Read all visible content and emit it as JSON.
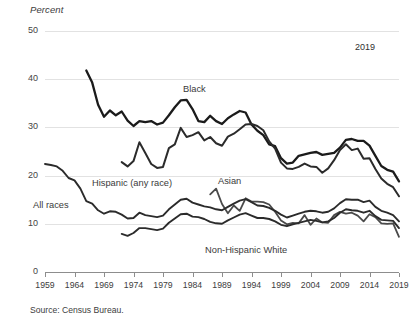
{
  "chart_data": {
    "type": "line",
    "title": "",
    "ylabel": "Percent",
    "xlabel": "",
    "ylim": [
      0,
      50
    ],
    "xlim": [
      1959,
      2019
    ],
    "yticks": [
      0,
      10,
      20,
      30,
      40,
      50
    ],
    "xticks": [
      1959,
      1964,
      1969,
      1974,
      1979,
      1984,
      1989,
      1994,
      1999,
      2004,
      2009,
      2014,
      2019
    ],
    "grid": true,
    "legend_position": "inline-annotations",
    "annotations": [
      "2019"
    ],
    "source": "Source: Census Bureau.",
    "series": [
      {
        "name": "Black",
        "color": "#1b1b1b",
        "width": 2.3,
        "x": [
          1966,
          1967,
          1968,
          1969,
          1970,
          1971,
          1972,
          1973,
          1974,
          1975,
          1976,
          1977,
          1978,
          1979,
          1980,
          1981,
          1982,
          1983,
          1984,
          1985,
          1986,
          1987,
          1988,
          1989,
          1990,
          1991,
          1992,
          1993,
          1994,
          1995,
          1996,
          1997,
          1998,
          1999,
          2000,
          2001,
          2002,
          2003,
          2004,
          2005,
          2006,
          2007,
          2008,
          2009,
          2010,
          2011,
          2012,
          2013,
          2014,
          2015,
          2016,
          2017,
          2018,
          2019
        ],
        "y": [
          41.8,
          39.3,
          34.7,
          32.2,
          33.5,
          32.5,
          33.3,
          31.4,
          30.3,
          31.3,
          31.1,
          31.3,
          30.6,
          31.0,
          32.5,
          34.2,
          35.6,
          35.7,
          33.8,
          31.3,
          31.1,
          32.4,
          31.3,
          30.7,
          31.9,
          32.7,
          33.4,
          33.1,
          30.6,
          29.3,
          28.4,
          26.5,
          26.1,
          23.6,
          22.5,
          22.7,
          24.1,
          24.4,
          24.7,
          24.9,
          24.3,
          24.5,
          24.7,
          25.8,
          27.4,
          27.6,
          27.2,
          27.2,
          26.2,
          24.1,
          22.0,
          21.2,
          20.8,
          18.8
        ]
      },
      {
        "name": "Hispanic (any race)",
        "color": "#2b2b2b",
        "width": 2.0,
        "x": [
          1972,
          1973,
          1974,
          1975,
          1976,
          1977,
          1978,
          1979,
          1980,
          1981,
          1982,
          1983,
          1984,
          1985,
          1986,
          1987,
          1988,
          1989,
          1990,
          1991,
          1992,
          1993,
          1994,
          1995,
          1996,
          1997,
          1998,
          1999,
          2000,
          2001,
          2002,
          2003,
          2004,
          2005,
          2006,
          2007,
          2008,
          2009,
          2010,
          2011,
          2012,
          2013,
          2014,
          2015,
          2016,
          2017,
          2018,
          2019
        ],
        "y": [
          22.8,
          21.9,
          23.0,
          26.9,
          24.7,
          22.4,
          21.6,
          21.8,
          25.7,
          26.5,
          29.9,
          28.0,
          28.4,
          29.0,
          27.3,
          28.0,
          26.7,
          26.2,
          28.1,
          28.7,
          29.6,
          30.6,
          30.7,
          30.3,
          29.4,
          27.1,
          25.6,
          22.7,
          21.5,
          21.4,
          21.8,
          22.5,
          21.9,
          21.8,
          20.6,
          21.5,
          23.2,
          25.3,
          26.5,
          25.3,
          25.6,
          23.5,
          23.6,
          21.4,
          19.4,
          18.3,
          17.6,
          15.7
        ]
      },
      {
        "name": "Asian",
        "color": "#4a4a4a",
        "width": 1.8,
        "x": [
          1987,
          1988,
          1989,
          1990,
          1991,
          1992,
          1993,
          1994,
          1995,
          1996,
          1997,
          1998,
          1999,
          2000,
          2001,
          2002,
          2003,
          2004,
          2005,
          2006,
          2007,
          2008,
          2009,
          2010,
          2011,
          2012,
          2013,
          2014,
          2015,
          2016,
          2017,
          2018,
          2019
        ],
        "y": [
          16.1,
          17.3,
          14.1,
          12.2,
          13.8,
          12.7,
          15.3,
          14.6,
          14.6,
          14.5,
          14.0,
          12.5,
          10.7,
          9.9,
          10.2,
          10.1,
          11.8,
          9.8,
          11.1,
          10.3,
          10.2,
          11.8,
          12.5,
          12.1,
          12.3,
          11.7,
          10.5,
          12.0,
          11.4,
          10.1,
          10.0,
          10.1,
          7.3
        ]
      },
      {
        "name": "All races",
        "color": "#2b2b2b",
        "width": 1.9,
        "x": [
          1959,
          1960,
          1961,
          1962,
          1963,
          1964,
          1965,
          1966,
          1967,
          1968,
          1969,
          1970,
          1971,
          1972,
          1973,
          1974,
          1975,
          1976,
          1977,
          1978,
          1979,
          1980,
          1981,
          1982,
          1983,
          1984,
          1985,
          1986,
          1987,
          1988,
          1989,
          1990,
          1991,
          1992,
          1993,
          1994,
          1995,
          1996,
          1997,
          1998,
          1999,
          2000,
          2001,
          2002,
          2003,
          2004,
          2005,
          2006,
          2007,
          2008,
          2009,
          2010,
          2011,
          2012,
          2013,
          2014,
          2015,
          2016,
          2017,
          2018,
          2019
        ],
        "y": [
          22.4,
          22.2,
          21.9,
          21.0,
          19.5,
          19.0,
          17.3,
          14.7,
          14.2,
          12.8,
          12.1,
          12.6,
          12.5,
          11.9,
          11.1,
          11.2,
          12.3,
          11.8,
          11.6,
          11.4,
          11.7,
          13.0,
          14.0,
          15.0,
          15.2,
          14.4,
          14.0,
          13.6,
          13.4,
          13.0,
          12.8,
          13.5,
          14.2,
          14.8,
          15.1,
          14.5,
          13.8,
          13.7,
          13.3,
          12.7,
          11.9,
          11.3,
          11.7,
          12.1,
          12.5,
          12.7,
          12.6,
          12.3,
          12.5,
          13.2,
          14.3,
          15.1,
          15.0,
          15.0,
          14.5,
          14.8,
          13.5,
          12.7,
          12.3,
          11.8,
          10.5
        ]
      },
      {
        "name": "Non-Hispanic White",
        "color": "#2b2b2b",
        "width": 1.9,
        "x": [
          1972,
          1973,
          1974,
          1975,
          1976,
          1977,
          1978,
          1979,
          1980,
          1981,
          1982,
          1983,
          1984,
          1985,
          1986,
          1987,
          1988,
          1989,
          1990,
          1991,
          1992,
          1993,
          1994,
          1995,
          1996,
          1997,
          1998,
          1999,
          2000,
          2001,
          2002,
          2003,
          2004,
          2005,
          2006,
          2007,
          2008,
          2009,
          2010,
          2011,
          2012,
          2013,
          2014,
          2015,
          2016,
          2017,
          2018,
          2019
        ],
        "y": [
          7.9,
          7.5,
          8.1,
          9.1,
          9.1,
          8.9,
          8.7,
          9.0,
          10.2,
          11.1,
          12.0,
          12.1,
          11.5,
          11.4,
          11.0,
          10.4,
          10.1,
          10.0,
          10.7,
          11.3,
          11.9,
          12.2,
          11.7,
          11.2,
          11.2,
          11.0,
          10.5,
          9.8,
          9.5,
          9.9,
          10.2,
          10.5,
          10.8,
          10.6,
          10.3,
          10.5,
          11.2,
          12.3,
          13.0,
          12.8,
          12.7,
          12.3,
          12.7,
          11.6,
          10.8,
          10.7,
          10.6,
          9.1
        ]
      }
    ]
  },
  "labels": {
    "percent": "Percent",
    "year_note": "2019",
    "black": "Black",
    "hispanic": "Hispanic (any race)",
    "asian": "Asian",
    "all_races": "All races",
    "nhwhite": "Non-Hispanic White",
    "source": "Source: Census Bureau."
  }
}
